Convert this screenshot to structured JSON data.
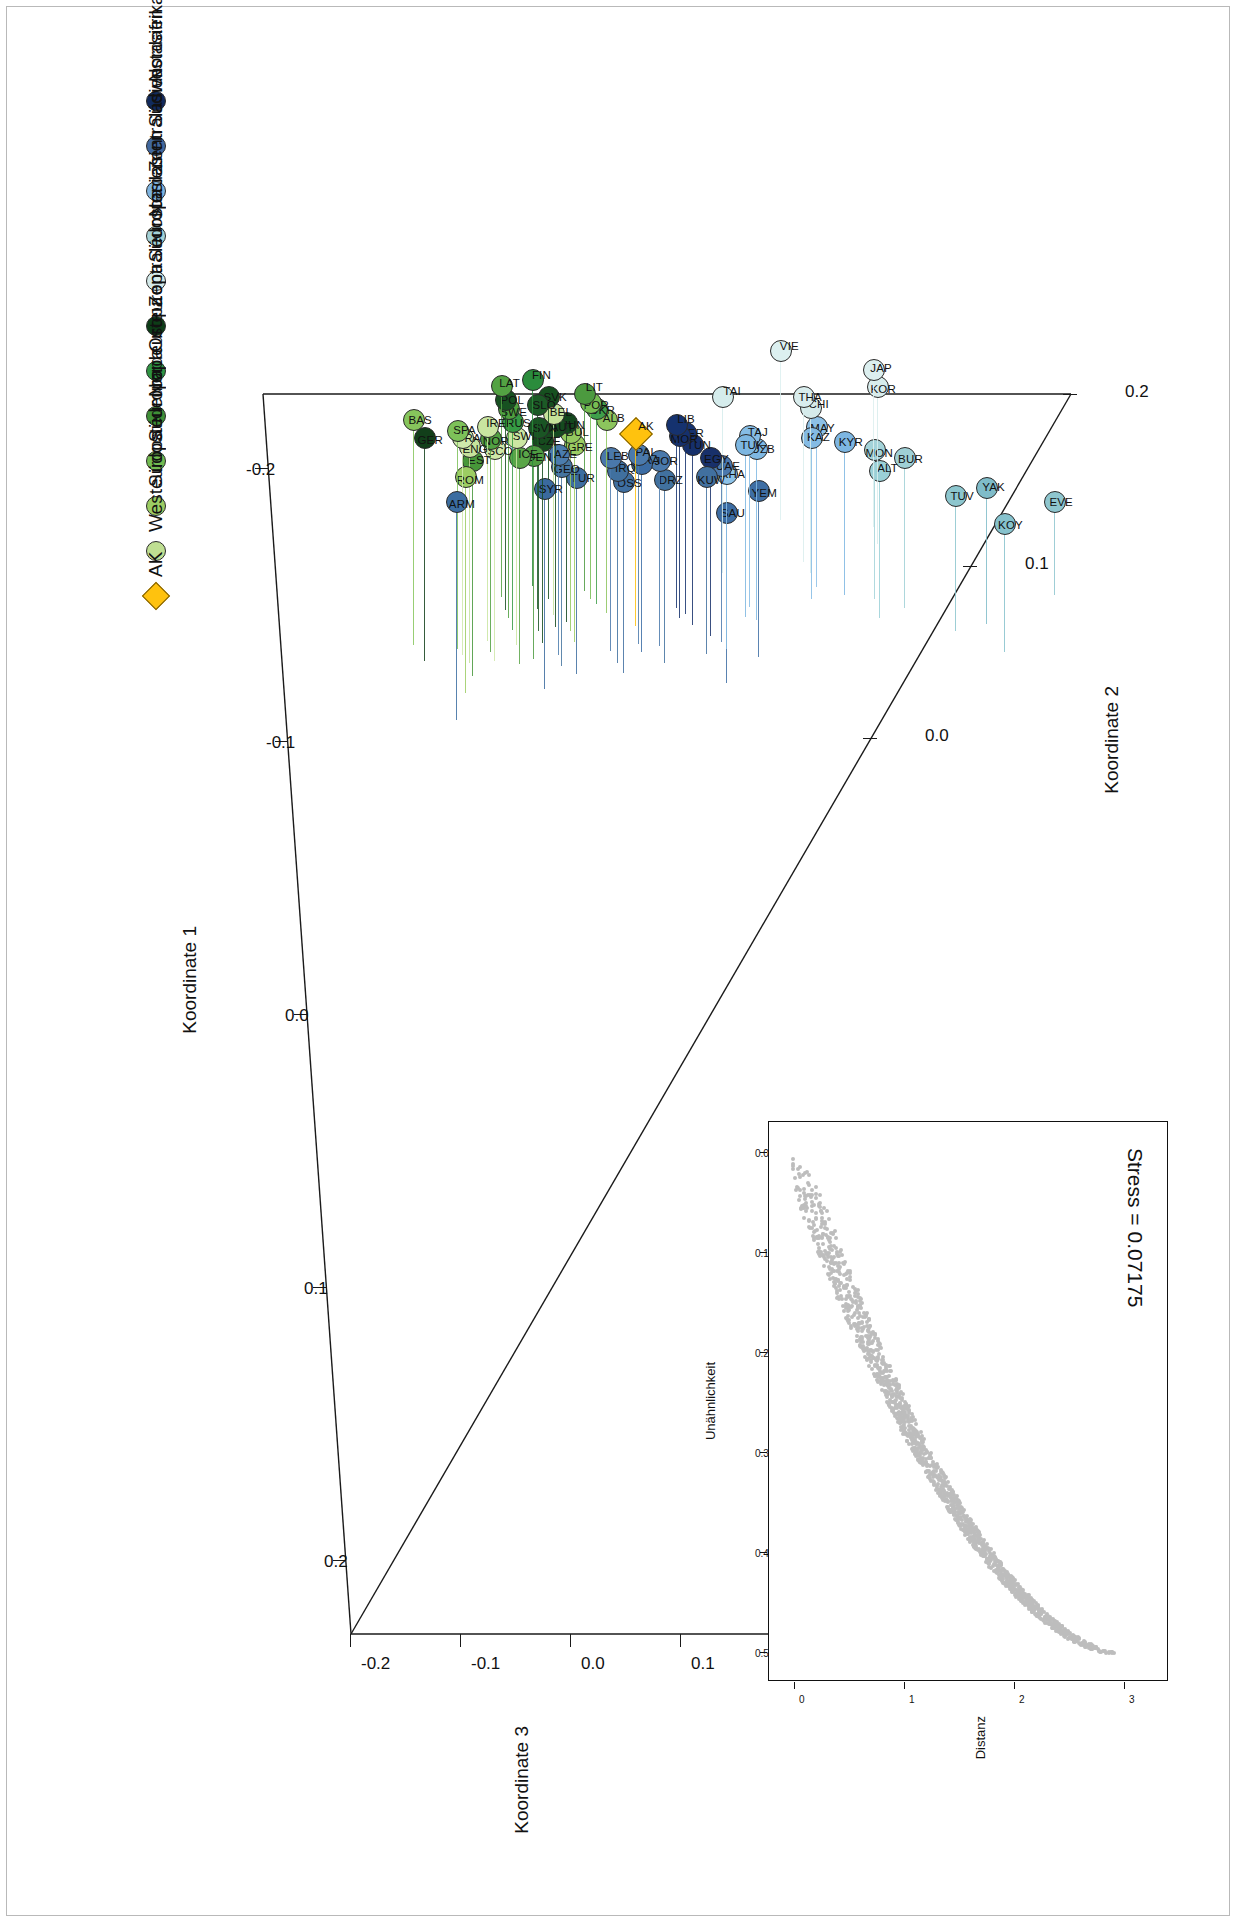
{
  "figure": {
    "orientation": "landscape-rotated-90",
    "stress_label": "Stress = 0.07175"
  },
  "axes": {
    "x_title": "Koordinate 1",
    "y_title": "Koordinate 2",
    "y2_title": "Koordinate 3",
    "x_ticks": [
      "-0.2",
      "-0.1",
      "0.0",
      "0.1",
      "0.2"
    ],
    "y_ticks": [
      "0.0",
      "0.1",
      "0.2"
    ],
    "y2_ticks": [
      "-0.2",
      "-0.1",
      "0.0",
      "0.1",
      "0.2"
    ]
  },
  "inset": {
    "x_title": "Unähnlichkeit",
    "y_title": "Distanz",
    "x_ticks": [
      "0.0",
      "0.1",
      "0.2",
      "0.3",
      "0.4",
      "0.5"
    ],
    "y_ticks": [
      "0",
      "1",
      "2",
      "3"
    ],
    "stress": "Stress = 0.07175"
  },
  "legend": {
    "marker": "-",
    "items": [
      {
        "label": "Nordafrika",
        "color": "#112a5c",
        "shape": "circle"
      },
      {
        "label": "Südwestasien",
        "color": "#41689e",
        "shape": "circle"
      },
      {
        "label": "Zentralasien",
        "color": "#7fb4e0",
        "shape": "circle"
      },
      {
        "label": "Nordasien",
        "color": "#a5d2d7",
        "shape": "circle"
      },
      {
        "label": "Südostasien",
        "color": "#d4eaea",
        "shape": "circle"
      },
      {
        "label": "Zentraleuropa",
        "color": "#0d3d17",
        "shape": "circle"
      },
      {
        "label": "Osteuropa",
        "color": "#2f9443",
        "shape": "circle"
      },
      {
        "label": "Nordeuropa",
        "color": "#3f8f37",
        "shape": "circle"
      },
      {
        "label": "Südeuropa",
        "color": "#72bb51",
        "shape": "circle"
      },
      {
        "label": "Südosteuropa",
        "color": "#9ccd63",
        "shape": "circle"
      },
      {
        "label": "Westeuropa",
        "color": "#bfdf92",
        "shape": "circle"
      },
      {
        "label": "AK",
        "color": "#ffc20e",
        "shape": "diamond"
      }
    ]
  },
  "chart_data": {
    "type": "scatter",
    "title": "",
    "xlabel": "Koordinate 1",
    "ylabel": "Koordinate 2",
    "zlabel": "Koordinate 3",
    "xlim": [
      -0.22,
      0.24
    ],
    "ylim": [
      -0.06,
      0.22
    ],
    "grid": false,
    "legend_position": "bottom-left",
    "note": "3D MDS projection; each point drawn with a drop-line to its Koordinate-3 base plane",
    "points": [
      {
        "label": "EVE",
        "group": "Nordasien",
        "color": "#8ec6cf",
        "x": 0.214,
        "y": 0.108,
        "z": 0.113
      },
      {
        "label": "KOY",
        "group": "Nordasien",
        "color": "#86c2cd",
        "x": 0.228,
        "y": 0.158,
        "z": 0.148
      },
      {
        "label": "YAK",
        "group": "Nordasien",
        "color": "#7fbcc9",
        "x": 0.205,
        "y": 0.176,
        "z": 0.156
      },
      {
        "label": "TUV",
        "group": "Nordasien",
        "color": "#8cc6ce",
        "x": 0.21,
        "y": 0.207,
        "z": 0.155
      },
      {
        "label": "BUR",
        "group": "Nordasien",
        "color": "#9fd0d6",
        "x": 0.186,
        "y": 0.258,
        "z": 0.17
      },
      {
        "label": "ALT",
        "group": "Nordasien",
        "color": "#9ad0d7",
        "x": 0.194,
        "y": 0.283,
        "z": 0.167
      },
      {
        "label": "MON",
        "group": "Nordasien",
        "color": "#a3d3d9",
        "x": 0.181,
        "y": 0.288,
        "z": 0.169
      },
      {
        "label": "KOR",
        "group": "Südostasien",
        "color": "#d7ecec",
        "x": 0.141,
        "y": 0.285,
        "z": 0.177
      },
      {
        "label": "JAP",
        "group": "Südostasien",
        "color": "#dcefef",
        "x": 0.13,
        "y": 0.289,
        "z": 0.177
      },
      {
        "label": "KYR",
        "group": "Zentralasien",
        "color": "#7db6e2",
        "x": 0.176,
        "y": 0.318,
        "z": 0.173
      },
      {
        "label": "MAY",
        "group": "Zentralasien",
        "color": "#8cc0e6",
        "x": 0.166,
        "y": 0.346,
        "z": 0.18
      },
      {
        "label": "KAZ",
        "group": "Zentralasien",
        "color": "#84bbe4",
        "x": 0.173,
        "y": 0.351,
        "z": 0.181
      },
      {
        "label": "CHI",
        "group": "Südostasien",
        "color": "#d5ebeb",
        "x": 0.154,
        "y": 0.352,
        "z": 0.185
      },
      {
        "label": "THA",
        "group": "Südostasien",
        "color": "#d9eded",
        "x": 0.147,
        "y": 0.359,
        "z": 0.185
      },
      {
        "label": "VIE",
        "group": "Südostasien",
        "color": "#dcf0f0",
        "x": 0.118,
        "y": 0.382,
        "z": 0.189
      },
      {
        "label": "YEM",
        "group": "Südwestasien",
        "color": "#3e6ea4",
        "x": 0.207,
        "y": 0.404,
        "z": 0.186
      },
      {
        "label": "UZB",
        "group": "Zentralasien",
        "color": "#7fb8e3",
        "x": 0.18,
        "y": 0.406,
        "z": 0.191
      },
      {
        "label": "TAJ",
        "group": "Zentralasien",
        "color": "#85bce5",
        "x": 0.172,
        "y": 0.413,
        "z": 0.191
      },
      {
        "label": "TUK",
        "group": "Zentralasien",
        "color": "#7cb6e1",
        "x": 0.178,
        "y": 0.417,
        "z": 0.192
      },
      {
        "label": "SAU",
        "group": "Südwestasien",
        "color": "#3c6ca3",
        "x": 0.221,
        "y": 0.436,
        "z": 0.19
      },
      {
        "label": "KHA",
        "group": "Zentralasien",
        "color": "#8cc2e8",
        "x": 0.196,
        "y": 0.436,
        "z": 0.195
      },
      {
        "label": "UAE",
        "group": "Südwestasien",
        "color": "#4c79ad",
        "x": 0.191,
        "y": 0.441,
        "z": 0.196
      },
      {
        "label": "TAI",
        "group": "Südostasien",
        "color": "#d5ecec",
        "x": 0.147,
        "y": 0.44,
        "z": 0.196
      },
      {
        "label": "EGY",
        "group": "Nordafrika",
        "color": "#18306a",
        "x": 0.186,
        "y": 0.452,
        "z": 0.198
      },
      {
        "label": "KUW",
        "group": "Südwestasien",
        "color": "#41709f",
        "x": 0.198,
        "y": 0.456,
        "z": 0.197
      },
      {
        "label": "TUN",
        "group": "Nordafrika",
        "color": "#16306b",
        "x": 0.178,
        "y": 0.47,
        "z": 0.2
      },
      {
        "label": "BER",
        "group": "Nordafrika",
        "color": "#16326f",
        "x": 0.17,
        "y": 0.477,
        "z": 0.201
      },
      {
        "label": "MOR",
        "group": "Nordafrika",
        "color": "#15306c",
        "x": 0.172,
        "y": 0.483,
        "z": 0.202
      },
      {
        "label": "LIB",
        "group": "Nordafrika",
        "color": "#15326f",
        "x": 0.165,
        "y": 0.486,
        "z": 0.203
      },
      {
        "label": "DRZ",
        "group": "Südwestasien",
        "color": "#41719f",
        "x": 0.2,
        "y": 0.498,
        "z": 0.203
      },
      {
        "label": "JOR",
        "group": "Südwestasien",
        "color": "#4a79ab",
        "x": 0.188,
        "y": 0.503,
        "z": 0.205
      },
      {
        "label": "IRA",
        "group": "Südwestasien",
        "color": "#3b6ca4",
        "x": 0.19,
        "y": 0.521,
        "z": 0.208
      },
      {
        "label": "PAL",
        "group": "Südwestasien",
        "color": "#4b7aac",
        "x": 0.184,
        "y": 0.524,
        "z": 0.209
      },
      {
        "label": "AK",
        "group": "AK",
        "color": "#ffc20e",
        "x": 0.171,
        "y": 0.527,
        "z": 0.212
      },
      {
        "label": "OSS",
        "group": "Südwestasien",
        "color": "#3f6fa1",
        "x": 0.201,
        "y": 0.539,
        "z": 0.211
      },
      {
        "label": "IRQ",
        "group": "Südwestasien",
        "color": "#40709f",
        "x": 0.194,
        "y": 0.545,
        "z": 0.212
      },
      {
        "label": "LEB",
        "group": "Südwestasien",
        "color": "#4a78ab",
        "x": 0.186,
        "y": 0.552,
        "z": 0.213
      },
      {
        "label": "ALB",
        "group": "Südosteuropa",
        "color": "#8cc45d",
        "x": 0.162,
        "y": 0.556,
        "z": 0.213
      },
      {
        "label": "UKR",
        "group": "Osteuropa",
        "color": "#3f9f4a",
        "x": 0.155,
        "y": 0.566,
        "z": 0.215
      },
      {
        "label": "POR",
        "group": "Südeuropa",
        "color": "#76bd53",
        "x": 0.151,
        "y": 0.572,
        "z": 0.216
      },
      {
        "label": "LIT",
        "group": "Nordeuropa",
        "color": "#4c9a3f",
        "x": 0.145,
        "y": 0.578,
        "z": 0.217
      },
      {
        "label": "TUR",
        "group": "Südwestasien",
        "color": "#3d6da0",
        "x": 0.199,
        "y": 0.586,
        "z": 0.216
      },
      {
        "label": "GRE",
        "group": "Südosteuropa",
        "color": "#9ccd63",
        "x": 0.178,
        "y": 0.588,
        "z": 0.217
      },
      {
        "label": "BUL",
        "group": "Südosteuropa",
        "color": "#94c85f",
        "x": 0.17,
        "y": 0.592,
        "z": 0.218
      },
      {
        "label": "HUN",
        "group": "Zentraleuropa",
        "color": "#13471d",
        "x": 0.164,
        "y": 0.596,
        "z": 0.219
      },
      {
        "label": "GEO",
        "group": "Südwestasien",
        "color": "#45749f",
        "x": 0.192,
        "y": 0.601,
        "z": 0.219
      },
      {
        "label": "AZE",
        "group": "Südwestasien",
        "color": "#4b7cad",
        "x": 0.184,
        "y": 0.604,
        "z": 0.22
      },
      {
        "label": "AUT",
        "group": "Zentraleuropa",
        "color": "#154a1f",
        "x": 0.166,
        "y": 0.607,
        "z": 0.22
      },
      {
        "label": "BEL",
        "group": "Westeuropa",
        "color": "#c5e29a",
        "x": 0.158,
        "y": 0.609,
        "z": 0.221
      },
      {
        "label": "SVK",
        "group": "Zentraleuropa",
        "color": "#16501f",
        "x": 0.147,
        "y": 0.614,
        "z": 0.222
      },
      {
        "label": "SYR",
        "group": "Südwestasien",
        "color": "#3a6a9e",
        "x": 0.206,
        "y": 0.618,
        "z": 0.22
      },
      {
        "label": "CZE",
        "group": "Zentraleuropa",
        "color": "#164b1e",
        "x": 0.175,
        "y": 0.62,
        "z": 0.222
      },
      {
        "label": "SVN",
        "group": "Zentraleuropa",
        "color": "#1a5524",
        "x": 0.167,
        "y": 0.624,
        "z": 0.223
      },
      {
        "label": "SLO",
        "group": "Zentraleuropa",
        "color": "#1c5a26",
        "x": 0.152,
        "y": 0.625,
        "z": 0.224
      },
      {
        "label": "DEN",
        "group": "Nordeuropa",
        "color": "#4e9b41",
        "x": 0.185,
        "y": 0.629,
        "z": 0.223
      },
      {
        "label": "FIN",
        "group": "Osteuropa",
        "color": "#2b8c3c",
        "x": 0.136,
        "y": 0.63,
        "z": 0.226
      },
      {
        "label": "ICE",
        "group": "Nordeuropa",
        "color": "#5aa548",
        "x": 0.186,
        "y": 0.643,
        "z": 0.226
      },
      {
        "label": "SWI",
        "group": "Westeuropa",
        "color": "#cbe6a2",
        "x": 0.173,
        "y": 0.646,
        "z": 0.227
      },
      {
        "label": "RUS",
        "group": "Osteuropa",
        "color": "#369a44",
        "x": 0.163,
        "y": 0.65,
        "z": 0.228
      },
      {
        "label": "SWE",
        "group": "Nordeuropa",
        "color": "#4fa03f",
        "x": 0.155,
        "y": 0.654,
        "z": 0.229
      },
      {
        "label": "POL",
        "group": "Zentraleuropa",
        "color": "#175121",
        "x": 0.149,
        "y": 0.657,
        "z": 0.23
      },
      {
        "label": "LAT",
        "group": "Nordeuropa",
        "color": "#53a243",
        "x": 0.14,
        "y": 0.661,
        "z": 0.231
      },
      {
        "label": "SCO",
        "group": "Westeuropa",
        "color": "#cfe8a9",
        "x": 0.18,
        "y": 0.668,
        "z": 0.232
      },
      {
        "label": "NOR",
        "group": "Nordeuropa",
        "color": "#51a041",
        "x": 0.174,
        "y": 0.672,
        "z": 0.233
      },
      {
        "label": "IRE",
        "group": "Westeuropa",
        "color": "#c9e5a0",
        "x": 0.166,
        "y": 0.675,
        "z": 0.234
      },
      {
        "label": "EST",
        "group": "Nordeuropa",
        "color": "#479739",
        "x": 0.188,
        "y": 0.69,
        "z": 0.235
      },
      {
        "label": "ENG",
        "group": "Westeuropa",
        "color": "#c6e39c",
        "x": 0.179,
        "y": 0.693,
        "z": 0.236
      },
      {
        "label": "ROM",
        "group": "Südosteuropa",
        "color": "#9ccd63",
        "x": 0.198,
        "y": 0.697,
        "z": 0.236
      },
      {
        "label": "FRA",
        "group": "Westeuropa",
        "color": "#cfe9ab",
        "x": 0.173,
        "y": 0.7,
        "z": 0.237
      },
      {
        "label": "SPA",
        "group": "Südeuropa",
        "color": "#7dc159",
        "x": 0.169,
        "y": 0.705,
        "z": 0.238
      },
      {
        "label": "ARM",
        "group": "Südwestasien",
        "color": "#3b6da1",
        "x": 0.214,
        "y": 0.706,
        "z": 0.238
      },
      {
        "label": "GER",
        "group": "Zentraleuropa",
        "color": "#123f1a",
        "x": 0.173,
        "y": 0.738,
        "z": 0.243
      },
      {
        "label": "BAS",
        "group": "Südeuropa",
        "color": "#86c55c",
        "x": 0.162,
        "y": 0.749,
        "z": 0.245
      }
    ]
  }
}
